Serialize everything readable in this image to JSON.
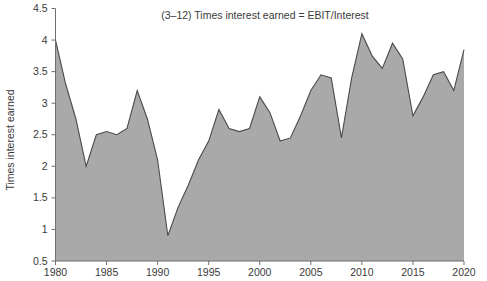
{
  "chart_data": {
    "type": "area",
    "title": "(3–12) Times interest earned = EBIT/Interest",
    "xlabel": "",
    "ylabel": "Times interest earned",
    "ylim": [
      0.5,
      4.5
    ],
    "xlim": [
      1980,
      2020
    ],
    "grid": false,
    "legend": null,
    "yticks": [
      "0.5",
      "1",
      "1.5",
      "2",
      "2.5",
      "3",
      "3.5",
      "4",
      "4.5"
    ],
    "ytick_values": [
      0.5,
      1,
      1.5,
      2,
      2.5,
      3,
      3.5,
      4,
      4.5
    ],
    "xticks": [
      "1980",
      "1985",
      "1990",
      "1995",
      "2000",
      "2005",
      "2010",
      "2015",
      "2020"
    ],
    "xtick_values": [
      1980,
      1985,
      1990,
      1995,
      2000,
      2005,
      2010,
      2015,
      2020
    ],
    "series": [
      {
        "name": "Times interest earned",
        "fill_color": "#a9a9a9",
        "line_color": "#4a4a4a",
        "x": [
          1980,
          1981,
          1982,
          1983,
          1984,
          1985,
          1986,
          1987,
          1988,
          1989,
          1990,
          1991,
          1992,
          1993,
          1994,
          1995,
          1996,
          1997,
          1998,
          1999,
          2000,
          2001,
          2002,
          2003,
          2004,
          2005,
          2006,
          2007,
          2008,
          2009,
          2010,
          2011,
          2012,
          2013,
          2014,
          2015,
          2016,
          2017,
          2018,
          2019,
          2020
        ],
        "values": [
          4.0,
          3.3,
          2.75,
          2.0,
          2.5,
          2.55,
          2.5,
          2.6,
          3.2,
          2.75,
          2.1,
          0.9,
          1.35,
          1.7,
          2.1,
          2.4,
          2.9,
          2.6,
          2.55,
          2.6,
          3.1,
          2.85,
          2.4,
          2.45,
          2.8,
          3.2,
          3.45,
          3.4,
          2.45,
          3.4,
          4.1,
          3.75,
          3.55,
          3.95,
          3.7,
          2.8,
          3.1,
          3.45,
          3.5,
          3.2,
          3.85
        ]
      }
    ]
  },
  "labels": {
    "y_axis_title": "Times interest earned",
    "chart_title": "(3–12) Times interest earned = EBIT/Interest"
  },
  "colors": {
    "area_fill": "#a9a9a9",
    "area_line": "#4a4a4a",
    "axis": "#6f6f6f",
    "text": "#3a3a3a",
    "background": "#ffffff"
  }
}
